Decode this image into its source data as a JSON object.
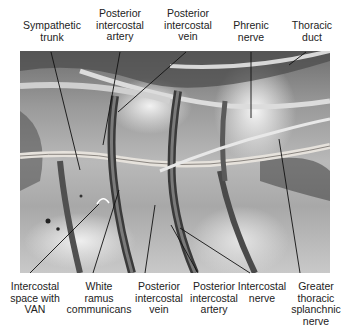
{
  "figure": {
    "type": "anatomical photograph with leader-line labels"
  },
  "labels_top": [
    {
      "id": "sympathetic-trunk",
      "text": "Sympathetic\ntrunk"
    },
    {
      "id": "posterior-intercostal-artery-top",
      "text": "Posterior\nintercostal\nartery"
    },
    {
      "id": "posterior-intercostal-vein-top",
      "text": "Posterior\nintercostal\nvein"
    },
    {
      "id": "phrenic-nerve",
      "text": "Phrenic\nnerve"
    },
    {
      "id": "thoracic-duct",
      "text": "Thoracic\nduct"
    }
  ],
  "labels_bottom": [
    {
      "id": "intercostal-space-with-van",
      "text": "Intercostal\nspace with\nVAN"
    },
    {
      "id": "white-ramus-communicans",
      "text": "White\nramus\ncommunicans"
    },
    {
      "id": "posterior-intercostal-vein-bottom",
      "text": "Posterior\nintercostal\nvein"
    },
    {
      "id": "posterior-intercostal-artery-bottom",
      "text": "Posterior\nintercostal\nartery"
    },
    {
      "id": "intercostal-nerve",
      "text": "Intercostal\nnerve"
    },
    {
      "id": "greater-thoracic-splanchnic-nerve",
      "text": "Greater\nthoracic\nsplanchnic\nnerve"
    }
  ],
  "colors": {
    "label_text": "#222222",
    "leader_line": "#111111",
    "background": "#ffffff"
  }
}
